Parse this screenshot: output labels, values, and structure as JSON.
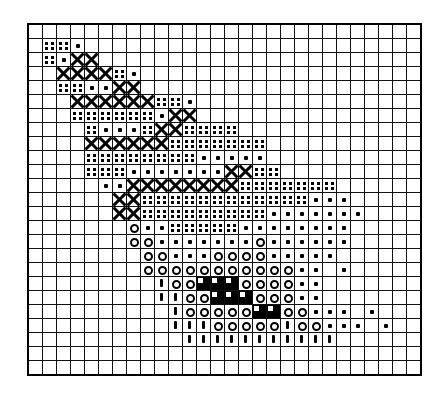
{
  "document": {
    "kind": "cross-stitch-chart",
    "title": "Cross-Stitch Pattern Chart",
    "background_color": "#ffffff",
    "ink_color": "#000000"
  },
  "chart": {
    "type": "grid-pattern",
    "columns": 28,
    "rows": 25,
    "cell_size_px": 14,
    "origin_x_px": 28,
    "origin_y_px": 24,
    "border_color": "#111111",
    "frame_color": "#000000"
  },
  "legend": {
    "symbols": [
      {
        "key": ".",
        "name": "blank-cell",
        "label": "empty",
        "css": ""
      },
      {
        "key": "q",
        "name": "four-dots-symbol",
        "label": "four dots",
        "css": "s-quad"
      },
      {
        "key": "d",
        "name": "single-dot-symbol",
        "label": "single dot",
        "css": "s-dot"
      },
      {
        "key": "x",
        "name": "cross-symbol",
        "label": "cross X",
        "css": "s-x"
      },
      {
        "key": "o",
        "name": "open-circle-symbol",
        "label": "open circle",
        "css": "s-o"
      },
      {
        "key": "i",
        "name": "vertical-bar-symbol",
        "label": "vertical bar",
        "css": "s-bar"
      },
      {
        "key": "f",
        "name": "solid-fill-symbol",
        "label": "solid black",
        "css": "s-fill"
      },
      {
        "key": "n",
        "name": "notched-fill-symbol",
        "label": "notched black",
        "css": "s-notch"
      }
    ]
  },
  "grid_rows": [
    "............................",
    ".qqd........................",
    ".qdxx.......................",
    "..xxxxqd....................",
    "..qqddxx....................",
    "...xxxxxxqqd................",
    "...qqqqqqdxx................",
    "....qdddqxxqqqq.............",
    "....xxxxxxqqqqqqq...........",
    "....qqqqqqqqddddd...........",
    "....qqqdddddddxxqq..........",
    ".....ddxxxxxxxxqqqqqqq......",
    "......xxqqqqqqqqqqqqddd.....",
    "......xxqqqqqqqqqddddddd....",
    ".......oddqqqqqdddddddd.....",
    ".......oodddddddodddddd.....",
    "........oodddooooddddd......",
    "........ooooooooooodd.d.....",
    ".........ioonnnoooodd.......",
    ".........iioonnnooodd.......",
    "..........iooooonnooddd.d...",
    "..........iiioooooiooddd.d..",
    "...........iiiiiiiiiii......",
    "............................",
    "............................"
  ]
}
